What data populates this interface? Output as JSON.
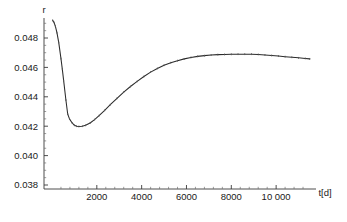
{
  "figure": {
    "background_color": "#ffffff",
    "line_color": "#2b2b2b",
    "axis_color": "#3a3a3a",
    "text_color": "#1a1a1a"
  },
  "chart_data": {
    "type": "line",
    "title": "",
    "xlabel": "t[d]",
    "ylabel": "r",
    "xlim": [
      0,
      11600
    ],
    "ylim": [
      0.0375,
      0.0495
    ],
    "grid": false,
    "legend": null,
    "xticks": [
      {
        "value": 2000,
        "label": "2000"
      },
      {
        "value": 4000,
        "label": "4000"
      },
      {
        "value": 6000,
        "label": "6000"
      },
      {
        "value": 8000,
        "label": "8000"
      },
      {
        "value": 10000,
        "label": "10 000"
      }
    ],
    "xticks_minor": [
      400,
      800,
      1200,
      1600,
      2400,
      2800,
      3200,
      3600,
      4400,
      4800,
      5200,
      5600,
      6400,
      6800,
      7200,
      7600,
      8400,
      8800,
      9200,
      9600,
      10400,
      10800,
      11200
    ],
    "yticks": [
      {
        "value": 0.038,
        "label": "0.038"
      },
      {
        "value": 0.04,
        "label": "0.040"
      },
      {
        "value": 0.042,
        "label": "0.042"
      },
      {
        "value": 0.044,
        "label": "0.044"
      },
      {
        "value": 0.046,
        "label": "0.046"
      },
      {
        "value": 0.048,
        "label": "0.048"
      }
    ],
    "yticks_minor": [
      0.0385,
      0.039,
      0.0395,
      0.0405,
      0.041,
      0.0415,
      0.0425,
      0.043,
      0.0435,
      0.0445,
      0.045,
      0.0455,
      0.0465,
      0.047,
      0.0475,
      0.0485,
      0.049
    ],
    "series": [
      {
        "name": "r",
        "x": [
          30,
          90,
          150,
          220,
          300,
          400,
          460,
          520,
          620,
          700,
          780,
          900,
          1000,
          1100,
          1200,
          1350,
          1500,
          1700,
          1900,
          2100,
          2350,
          2600,
          2900,
          3200,
          3500,
          3800,
          4100,
          4400,
          4700,
          5000,
          5300,
          5600,
          5900,
          6200,
          6500,
          6800,
          7100,
          7400,
          7700,
          8000,
          8300,
          8600,
          8900,
          9200,
          9500,
          9800,
          10100,
          10400,
          10700,
          11000,
          11300,
          11500
        ],
        "y": [
          0.0492,
          0.04906,
          0.0488,
          0.04836,
          0.0477,
          0.0466,
          0.04588,
          0.0451,
          0.04378,
          0.04283,
          0.0425,
          0.04222,
          0.04206,
          0.042,
          0.04198,
          0.042,
          0.04206,
          0.04222,
          0.04245,
          0.04272,
          0.04308,
          0.04346,
          0.0439,
          0.04432,
          0.0447,
          0.04505,
          0.04538,
          0.04568,
          0.04593,
          0.04615,
          0.04632,
          0.04646,
          0.04658,
          0.04668,
          0.04675,
          0.0468,
          0.04684,
          0.04687,
          0.04688,
          0.04689,
          0.0469,
          0.0469,
          0.0469,
          0.04688,
          0.04685,
          0.04681,
          0.04677,
          0.04673,
          0.04669,
          0.04665,
          0.04661,
          0.04658
        ]
      }
    ]
  }
}
